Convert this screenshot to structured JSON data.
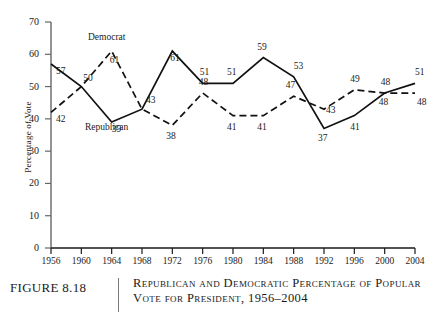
{
  "figure": {
    "number_label": "FIGURE 8.18",
    "caption_line_1": "Republican and Democratic Percentage of Popular",
    "caption_line_2": "Vote for President, 1956–2004"
  },
  "chart_data": {
    "type": "line",
    "title": "Republican and Democratic Percentage of Popular Vote for President, 1956–2004",
    "xlabel": "",
    "ylabel": "Percentage of Vote",
    "x": [
      1956,
      1960,
      1964,
      1968,
      1972,
      1976,
      1980,
      1984,
      1988,
      1992,
      1996,
      2000,
      2004
    ],
    "xtick_labels": [
      "1956",
      "1960",
      "1964",
      "1968",
      "1972",
      "1976",
      "1980",
      "1984",
      "1988",
      "1992",
      "1996",
      "2000",
      "2004"
    ],
    "ytick_labels": [
      "0",
      "10",
      "20",
      "30",
      "40",
      "50",
      "60",
      "70"
    ],
    "yticks": [
      0,
      10,
      20,
      30,
      40,
      50,
      60,
      70
    ],
    "ylim": [
      0,
      70
    ],
    "xlim": [
      1956,
      2004
    ],
    "grid": false,
    "legend_position": "inline-annotation",
    "series": [
      {
        "name": "Republican",
        "style": "solid",
        "color": "#111111",
        "values": [
          57,
          50,
          39,
          43,
          61,
          51,
          51,
          59,
          53,
          37,
          41,
          48,
          51
        ],
        "point_labels": [
          "57",
          "50",
          "39",
          "43",
          "61",
          "51",
          "51",
          "59",
          "53",
          "37",
          "41",
          "48",
          "51"
        ]
      },
      {
        "name": "Democrat",
        "style": "dashed",
        "color": "#111111",
        "values": [
          42,
          50,
          61,
          43,
          38,
          48,
          41,
          41,
          47,
          43,
          49,
          48,
          48
        ],
        "point_labels": [
          "42",
          "",
          "61",
          "",
          "38",
          "48",
          "41",
          "41",
          "47",
          "43",
          "49",
          "48",
          "48"
        ]
      }
    ],
    "annotations": [
      {
        "text": "Democrat",
        "series": "Democrat"
      },
      {
        "text": "Republican",
        "series": "Republican"
      }
    ]
  }
}
